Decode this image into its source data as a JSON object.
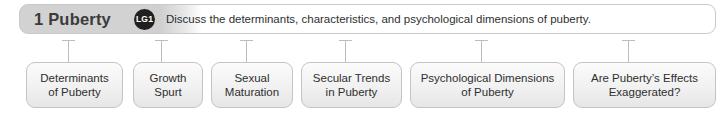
{
  "header": {
    "chapter_number_title": "1 Puberty",
    "badge_label": "LG1",
    "objective_text": "Discuss the determinants, characteristics, and psychological dimensions of puberty.",
    "badge_color": "#231f20",
    "bar_fill_color": "#d2d2d2",
    "border_color": "#c9c9c9"
  },
  "topics": [
    {
      "label": "Determinants of Puberty",
      "line1": "Determinants",
      "line2": "of Puberty",
      "left": 26,
      "width": 97,
      "connector_x": 68
    },
    {
      "label": "Growth Spurt",
      "line1": "Growth",
      "line2": "Spurt",
      "left": 133,
      "width": 70,
      "connector_x": 161
    },
    {
      "label": "Sexual Maturation",
      "line1": "Sexual",
      "line2": "Maturation",
      "left": 211,
      "width": 82,
      "connector_x": 246
    },
    {
      "label": "Secular Trends in Puberty",
      "line1": "Secular Trends",
      "line2": "in Puberty",
      "left": 301,
      "width": 101,
      "connector_x": 345
    },
    {
      "label": "Psychological Dimensions of Puberty",
      "line1": "Psychological Dimensions",
      "line2": "of Puberty",
      "left": 410,
      "width": 155,
      "connector_x": 481
    },
    {
      "label": "Are Puberty's Effects Exaggerated?",
      "line1": "Are Puberty’s Effects",
      "line2": "Exaggerated?",
      "left": 573,
      "width": 143,
      "connector_x": 628
    }
  ],
  "colors": {
    "box_border": "#c4c4c4",
    "connector": "#bdbdbd",
    "text": "#2f2f2f",
    "title_text": "#3b3b3b"
  }
}
